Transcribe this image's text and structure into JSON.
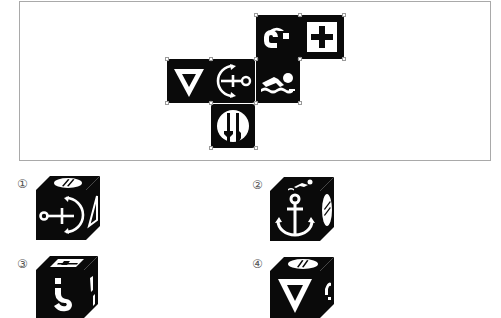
{
  "net": {
    "description": "Cube net with six pictogram faces",
    "faces": [
      {
        "id": "question",
        "icon": "question-mark-rotated-icon",
        "row": 0,
        "col": 2
      },
      {
        "id": "cross",
        "icon": "first-aid-cross-icon",
        "row": 0,
        "col": 3
      },
      {
        "id": "triangle",
        "icon": "inverted-triangle-icon",
        "row": 1,
        "col": 0
      },
      {
        "id": "anchor",
        "icon": "anchor-rotated-icon",
        "row": 1,
        "col": 1
      },
      {
        "id": "swimmer",
        "icon": "swimmer-icon",
        "row": 1,
        "col": 2
      },
      {
        "id": "cutlery",
        "icon": "fork-knife-icon",
        "row": 2,
        "col": 1
      }
    ]
  },
  "options": [
    {
      "label": "①",
      "number": 1,
      "front": "anchor (rotated, ring left)",
      "top": "fork-knife",
      "right": "triangle (rotated)"
    },
    {
      "label": "②",
      "number": 2,
      "front": "anchor (upright)",
      "top": "swimmer",
      "right": "fork-knife"
    },
    {
      "label": "③",
      "number": 3,
      "front": "question mark (inverted)",
      "top": "first-aid cross",
      "right": "swimmer (rotated)"
    },
    {
      "label": "④",
      "number": 4,
      "front": "inverted triangle",
      "top": "fork-knife",
      "right": "question mark (rotated)"
    }
  ],
  "colors": {
    "face": "#0a0a0a",
    "glyph": "#ffffff",
    "frame": "#a9a9a9"
  }
}
